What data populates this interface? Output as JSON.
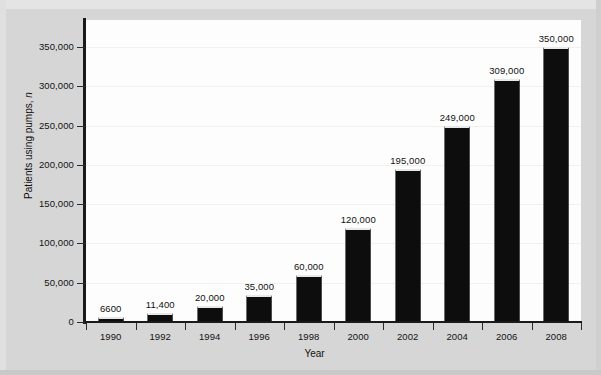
{
  "chart_data": {
    "type": "bar",
    "title": "",
    "xlabel": "Year",
    "ylabel": "Patients using pumps, n",
    "categories": [
      "1990",
      "1992",
      "1994",
      "1996",
      "1998",
      "2000",
      "2002",
      "2004",
      "2006",
      "2008"
    ],
    "values": [
      6600,
      11400,
      20000,
      35000,
      60000,
      120000,
      195000,
      249000,
      309000,
      350000
    ],
    "value_labels": [
      "6600",
      "11,400",
      "20,000",
      "35,000",
      "60,000",
      "120,000",
      "195,000",
      "249,000",
      "309,000",
      "350,000"
    ],
    "ylim": [
      0,
      350000
    ],
    "ytick_values": [
      0,
      50000,
      100000,
      150000,
      200000,
      250000,
      300000,
      350000
    ],
    "ytick_labels": [
      "0",
      "50,000",
      "100,000",
      "150,000",
      "200,000",
      "250,000",
      "300,000",
      "350,000"
    ],
    "grid": true,
    "legend": null,
    "legend_position": "none",
    "bar_color": "#0d0d0d",
    "plot_background": "#fdfdfd",
    "figure_background": "#d6d6d6"
  },
  "figure": {
    "ylabel_prefix": "Patients using pumps, ",
    "ylabel_italic": "n",
    "xlabel_text": "Year"
  }
}
